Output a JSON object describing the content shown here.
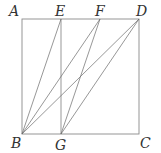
{
  "diagram": {
    "type": "geometry-square",
    "points": {
      "A": {
        "label": "A",
        "x": 22,
        "y": 19
      },
      "E": {
        "label": "E",
        "x": 61,
        "y": 19
      },
      "F": {
        "label": "F",
        "x": 100,
        "y": 19
      },
      "D": {
        "label": "D",
        "x": 139,
        "y": 19
      },
      "B": {
        "label": "B",
        "x": 22,
        "y": 134
      },
      "G": {
        "label": "G",
        "x": 61,
        "y": 134
      },
      "C": {
        "label": "C",
        "x": 139,
        "y": 134
      }
    },
    "square": [
      "A",
      "D",
      "C",
      "B"
    ],
    "segments": [
      [
        "E",
        "G"
      ],
      [
        "B",
        "E"
      ],
      [
        "B",
        "F"
      ],
      [
        "B",
        "D"
      ],
      [
        "G",
        "F"
      ],
      [
        "G",
        "D"
      ]
    ],
    "labels": {
      "A": "A",
      "E": "E",
      "F": "F",
      "D": "D",
      "B": "B",
      "G": "G",
      "C": "C"
    }
  }
}
